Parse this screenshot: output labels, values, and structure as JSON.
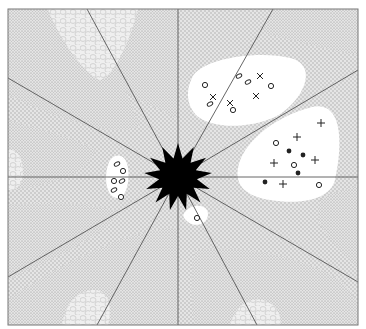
{
  "figure": {
    "width": 366,
    "height": 329,
    "frame": {
      "x": 8,
      "y": 9,
      "w": 350,
      "h": 316
    },
    "center": {
      "x": 178,
      "y": 177
    },
    "colors": {
      "background": "#ffffff",
      "fine_stipple_bg": "#e4e4e4",
      "fine_stipple_dot": "#8c8c8c",
      "medium_gray": "#cdcdcd",
      "medium_gray_dot": "#f2f2f2",
      "cobble_bg": "#efefef",
      "cobble_line": "#c4c4c4",
      "clear_zone": "#ffffff",
      "line": "#555555",
      "star": "#000000",
      "marker": "#222222"
    },
    "rays": [
      {
        "x": 87,
        "y": 9
      },
      {
        "x": 178,
        "y": 9
      },
      {
        "x": 273,
        "y": 9
      },
      {
        "x": 358,
        "y": 70
      },
      {
        "x": 358,
        "y": 177
      },
      {
        "x": 358,
        "y": 282
      },
      {
        "x": 257,
        "y": 325
      },
      {
        "x": 178,
        "y": 325
      },
      {
        "x": 97,
        "y": 325
      },
      {
        "x": 8,
        "y": 277
      },
      {
        "x": 8,
        "y": 177
      },
      {
        "x": 8,
        "y": 78
      }
    ],
    "star": {
      "points": 13,
      "outer_r": 34,
      "inner_r": 19
    },
    "clear_zones": [
      {
        "name": "upper-right-zone",
        "d": "M 192 78 C 200 58, 260 50, 290 58 C 322 66, 300 105, 275 117 C 245 130, 210 128, 196 115 C 186 104, 186 90, 192 78 Z"
      },
      {
        "name": "right-zone",
        "d": "M 238 168 C 242 145, 270 118, 312 107 C 345 100, 342 150, 335 180 C 330 200, 300 205, 270 200 C 245 196, 235 185, 238 168 Z"
      },
      {
        "name": "left-zone",
        "d": "M 108 165 C 112 152, 126 152, 128 168 C 130 182, 126 200, 116 198 C 106 195, 104 178, 108 165 Z"
      },
      {
        "name": "lower-zone",
        "d": "M 185 212 C 192 203, 208 204, 208 214 C 208 224, 196 228, 188 222 C 183 218, 182 215, 185 212 Z"
      }
    ],
    "fine_regions": [
      {
        "name": "top-right-fine",
        "d": "M 273 9 L 358 9 L 358 55 C 330 50, 300 42, 268 34 C 262 32, 265 20, 273 9 Z"
      },
      {
        "name": "top-left-fine",
        "d": "M 8 9 L 87 9 C 70 30, 50 60, 8 62 Z"
      },
      {
        "name": "top-mid-fine",
        "d": "M 87 9 L 178 9 L 178 120 C 165 110, 145 105, 130 95 C 110 80, 95 40, 87 9 Z"
      },
      {
        "name": "left-fine-a",
        "d": "M 8 62 C 50 60, 70 30, 87 9 L 100 9 C 110 60, 130 100, 140 125 C 120 140, 60 120, 8 95 Z"
      },
      {
        "name": "left-fine-b",
        "d": "M 8 120 C 40 130, 70 135, 95 150 C 90 170, 60 185, 8 190 Z"
      },
      {
        "name": "left-fine-c",
        "d": "M 8 205 C 60 200, 100 205, 120 212 C 100 240, 40 265, 8 280 Z"
      },
      {
        "name": "bottom-left-fine",
        "d": "M 8 300 C 30 282, 80 255, 120 240 C 140 232, 165 228, 178 228 L 178 325 L 8 325 Z"
      },
      {
        "name": "bottom-right-fine",
        "d": "M 195 250 C 240 245, 300 255, 340 280 C 350 290, 358 300, 358 310 L 358 325 L 195 325 C 190 300, 190 270, 195 250 Z"
      },
      {
        "name": "right-fine",
        "d": "M 320 200 C 335 190, 350 190, 358 185 L 358 270 C 345 255, 325 235, 318 220 Z"
      }
    ],
    "cobble_regions": [
      {
        "name": "top-cobble",
        "d": "M 48 9 L 138 9 C 130 40, 115 75, 100 80 C 85 75, 60 40, 48 9 Z"
      },
      {
        "name": "left-cobble",
        "d": "M 8 150 C 20 148, 25 165, 22 180 C 20 188, 12 190, 8 190 Z"
      },
      {
        "name": "bottom-left-cobble",
        "d": "M 62 325 C 66 300, 80 290, 95 290 C 110 290, 112 310, 108 325 Z"
      },
      {
        "name": "bottom-right-cobble",
        "d": "M 230 325 C 236 305, 250 297, 262 300 C 278 304, 282 318, 280 325 Z"
      }
    ],
    "markers": [
      {
        "type": "circle",
        "x": 205,
        "y": 85
      },
      {
        "type": "x",
        "x": 213,
        "y": 97
      },
      {
        "type": "diamond",
        "x": 210,
        "y": 104
      },
      {
        "type": "diamond",
        "x": 239,
        "y": 76
      },
      {
        "type": "diamond",
        "x": 248,
        "y": 82
      },
      {
        "type": "x",
        "x": 260,
        "y": 76
      },
      {
        "type": "circle",
        "x": 271,
        "y": 86
      },
      {
        "type": "x",
        "x": 256,
        "y": 96
      },
      {
        "type": "x",
        "x": 230,
        "y": 103
      },
      {
        "type": "circle",
        "x": 233,
        "y": 110
      },
      {
        "type": "plus",
        "x": 321,
        "y": 123
      },
      {
        "type": "plus",
        "x": 297,
        "y": 137
      },
      {
        "type": "circle",
        "x": 276,
        "y": 143
      },
      {
        "type": "dot",
        "x": 289,
        "y": 151
      },
      {
        "type": "dot",
        "x": 303,
        "y": 155
      },
      {
        "type": "plus",
        "x": 315,
        "y": 160
      },
      {
        "type": "plus",
        "x": 274,
        "y": 163
      },
      {
        "type": "circle",
        "x": 294,
        "y": 165
      },
      {
        "type": "dot",
        "x": 298,
        "y": 173
      },
      {
        "type": "dot",
        "x": 265,
        "y": 182
      },
      {
        "type": "plus",
        "x": 283,
        "y": 184
      },
      {
        "type": "circle",
        "x": 319,
        "y": 185
      },
      {
        "type": "diamond",
        "x": 117,
        "y": 164
      },
      {
        "type": "circle",
        "x": 123,
        "y": 171
      },
      {
        "type": "circle",
        "x": 114,
        "y": 181
      },
      {
        "type": "diamond",
        "x": 122,
        "y": 181
      },
      {
        "type": "diamond",
        "x": 114,
        "y": 190
      },
      {
        "type": "circle",
        "x": 121,
        "y": 197
      },
      {
        "type": "circle",
        "x": 197,
        "y": 218
      }
    ]
  }
}
